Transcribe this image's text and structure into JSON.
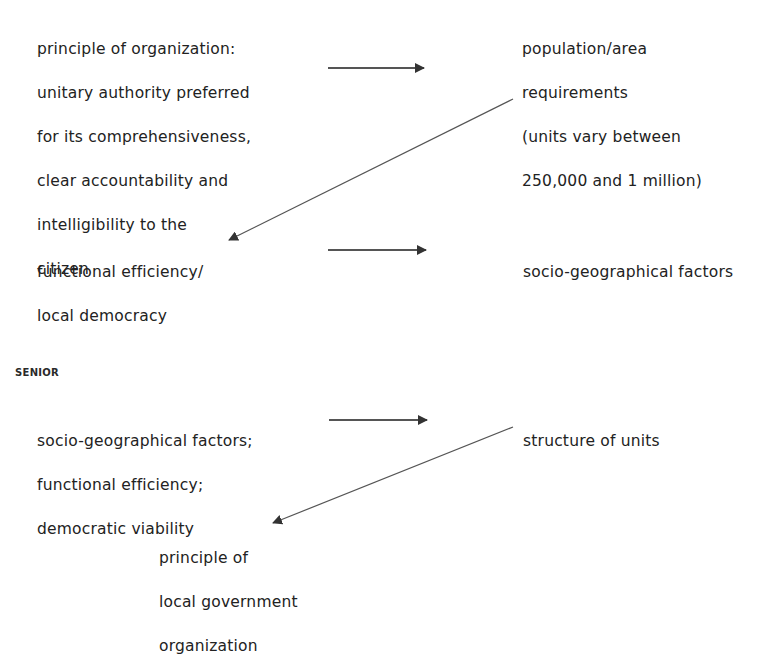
{
  "diagram": {
    "top": {
      "nodes": {
        "principle_of_organization": {
          "lines": [
            "principle of organization:",
            "unitary authority preferred",
            "for its comprehensiveness,",
            "clear accountability and",
            "intelligibility to the",
            "citizen"
          ]
        },
        "population_area": {
          "lines": [
            "population/area",
            "requirements",
            "(units vary between",
            "250,000 and 1 million)"
          ]
        },
        "functional_efficiency": {
          "lines": [
            "functional efficiency/",
            "local democracy"
          ]
        },
        "socio_geographical": {
          "lines": [
            "socio-geographical factors"
          ]
        }
      },
      "edges": [
        {
          "from": "principle_of_organization",
          "to": "population_area"
        },
        {
          "from": "population_area",
          "to": "functional_efficiency"
        },
        {
          "from": "functional_efficiency",
          "to": "socio_geographical"
        }
      ]
    },
    "bottom": {
      "section_label": "SENIOR",
      "nodes": {
        "factors_list": {
          "lines": [
            "socio-geographical factors;",
            "functional efficiency;",
            "democratic viability"
          ]
        },
        "structure_of_units": {
          "lines": [
            "structure of units"
          ]
        },
        "principle_local_gov": {
          "lines": [
            "principle of",
            "local government",
            "organization"
          ]
        }
      },
      "edges": [
        {
          "from": "factors_list",
          "to": "structure_of_units"
        },
        {
          "from": "structure_of_units",
          "to": "principle_local_gov"
        }
      ]
    },
    "colors": {
      "text": "#222222",
      "arrow": "#333333",
      "background": "#ffffff"
    }
  }
}
